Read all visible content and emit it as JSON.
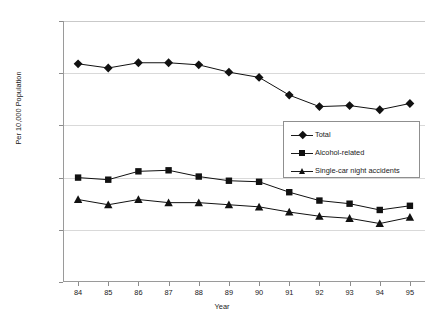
{
  "chart_data": {
    "type": "line",
    "title": "",
    "xlabel": "Year",
    "ylabel": "Per 10,000 Population",
    "categories": [
      "84",
      "85",
      "86",
      "87",
      "88",
      "89",
      "90",
      "91",
      "92",
      "93",
      "94",
      "95"
    ],
    "x": [
      84,
      85,
      86,
      87,
      88,
      89,
      90,
      91,
      92,
      93,
      94,
      95
    ],
    "xlim": [
      83.5,
      95.5
    ],
    "ylim": [
      0.0,
      2.5
    ],
    "ytick_labels": [
      "0.00",
      "0.50",
      "1.00",
      "1.50",
      "2.00",
      "2.50"
    ],
    "ytick_values": [
      0.0,
      0.5,
      1.0,
      1.5,
      2.0,
      2.5
    ],
    "grid": true,
    "grid_axis": "y",
    "legend_position": "center-right",
    "series": [
      {
        "name": "Total",
        "marker": "diamond",
        "color": "#111111",
        "values": [
          2.09,
          2.05,
          2.1,
          2.1,
          2.08,
          2.01,
          1.96,
          1.79,
          1.68,
          1.69,
          1.65,
          1.71
        ]
      },
      {
        "name": "Alcohol-related",
        "marker": "square",
        "color": "#111111",
        "values": [
          1.0,
          0.98,
          1.06,
          1.07,
          1.01,
          0.97,
          0.96,
          0.86,
          0.78,
          0.75,
          0.69,
          0.73
        ]
      },
      {
        "name": "Single-car night accidents",
        "marker": "triangle",
        "color": "#111111",
        "values": [
          0.79,
          0.74,
          0.79,
          0.76,
          0.76,
          0.74,
          0.72,
          0.67,
          0.63,
          0.61,
          0.56,
          0.62
        ]
      }
    ]
  },
  "axes": {
    "y_title": "Per 10,000 Population",
    "x_title": "Year"
  },
  "legend": {
    "items": [
      {
        "label": "Total",
        "marker": "diamond"
      },
      {
        "label": "Alcohol-related",
        "marker": "square"
      },
      {
        "label": "Single-car night accidents",
        "marker": "triangle"
      }
    ]
  }
}
